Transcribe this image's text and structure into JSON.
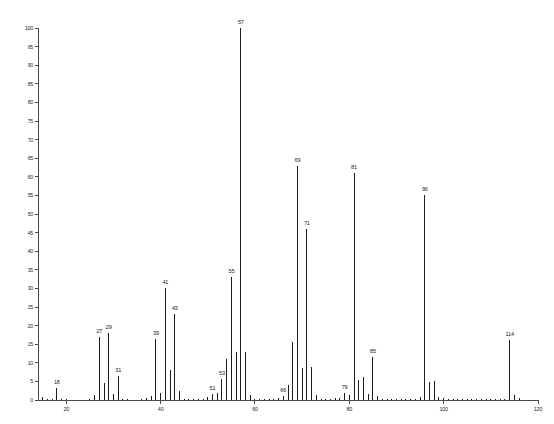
{
  "chart_data": {
    "type": "bar",
    "title": "",
    "subtitle": "",
    "xlabel": "",
    "ylabel": "",
    "xlim": [
      14,
      120
    ],
    "ylim": [
      0,
      100
    ],
    "grid": false,
    "legend": null,
    "x_ticks": [
      20,
      40,
      60,
      80,
      100,
      120
    ],
    "x_tick_labels": [
      "20",
      "40",
      "60",
      "80",
      "100",
      "120"
    ],
    "y_ticks": [
      0,
      5,
      10,
      15,
      20,
      25,
      30,
      35,
      40,
      45,
      50,
      55,
      60,
      65,
      70,
      75,
      80,
      85,
      90,
      95,
      100
    ],
    "y_tick_labels": [
      "0",
      "5",
      "10",
      "15",
      "20",
      "25",
      "30",
      "35",
      "40",
      "45",
      "50",
      "55",
      "60",
      "65",
      "70",
      "75",
      "80",
      "85",
      "90",
      "95",
      "100"
    ],
    "x": [
      15,
      16,
      17,
      18,
      19,
      20,
      25,
      26,
      27,
      28,
      29,
      30,
      31,
      32,
      33,
      36,
      37,
      38,
      39,
      40,
      41,
      42,
      43,
      44,
      45,
      46,
      47,
      48,
      49,
      50,
      51,
      52,
      53,
      54,
      55,
      56,
      57,
      58,
      59,
      60,
      61,
      62,
      63,
      64,
      65,
      66,
      67,
      68,
      69,
      70,
      71,
      72,
      73,
      74,
      75,
      76,
      77,
      78,
      79,
      80,
      81,
      82,
      83,
      84,
      85,
      86,
      87,
      88,
      89,
      90,
      91,
      92,
      93,
      94,
      95,
      96,
      97,
      98,
      99,
      100,
      101,
      102,
      103,
      104,
      105,
      106,
      107,
      108,
      109,
      110,
      111,
      112,
      113,
      114,
      115,
      116
    ],
    "values": [
      0.8,
      0.4,
      0.3,
      3.2,
      0.3,
      0.2,
      0.3,
      1.4,
      17.0,
      4.5,
      18.0,
      1.5,
      6.5,
      0.4,
      0.2,
      0.3,
      0.6,
      1.2,
      16.5,
      2.0,
      30.0,
      8.0,
      23.0,
      2.3,
      0.4,
      0.3,
      0.3,
      0.2,
      0.4,
      0.9,
      1.6,
      2.0,
      5.7,
      11.0,
      33.0,
      13.0,
      100.0,
      13.0,
      1.3,
      0.4,
      0.3,
      0.3,
      0.3,
      0.3,
      0.6,
      1.2,
      4.0,
      15.5,
      63.0,
      8.5,
      46.0,
      9.0,
      1.3,
      0.4,
      0.3,
      0.3,
      0.5,
      0.6,
      2.0,
      1.3,
      61.0,
      5.5,
      6.3,
      1.7,
      11.5,
      1.2,
      0.4,
      0.3,
      0.2,
      0.2,
      0.4,
      0.3,
      0.2,
      0.3,
      0.8,
      55.0,
      4.8,
      5.0,
      0.7,
      0.6,
      0.3,
      0.2,
      0.2,
      0.2,
      0.2,
      0.2,
      0.2,
      0.2,
      0.2,
      0.3,
      0.3,
      0.3,
      0.4,
      16.0,
      1.3,
      0.5
    ],
    "labeled_peaks": [
      {
        "mz": 18,
        "label": "18",
        "intensity": 3.2
      },
      {
        "mz": 27,
        "label": "27",
        "intensity": 17.0
      },
      {
        "mz": 29,
        "label": "29",
        "intensity": 18.0
      },
      {
        "mz": 31,
        "label": "31",
        "intensity": 6.5
      },
      {
        "mz": 39,
        "label": "39",
        "intensity": 16.5
      },
      {
        "mz": 41,
        "label": "41",
        "intensity": 30.0
      },
      {
        "mz": 43,
        "label": "43",
        "intensity": 23.0
      },
      {
        "mz": 51,
        "label": "51",
        "intensity": 1.6
      },
      {
        "mz": 53,
        "label": "53",
        "intensity": 5.7
      },
      {
        "mz": 55,
        "label": "55",
        "intensity": 33.0
      },
      {
        "mz": 57,
        "label": "57",
        "intensity": 100.0
      },
      {
        "mz": 66,
        "label": "66",
        "intensity": 1.2
      },
      {
        "mz": 69,
        "label": "69",
        "intensity": 63.0
      },
      {
        "mz": 71,
        "label": "71",
        "intensity": 46.0
      },
      {
        "mz": 79,
        "label": "79",
        "intensity": 2.0
      },
      {
        "mz": 81,
        "label": "81",
        "intensity": 61.0
      },
      {
        "mz": 85,
        "label": "85",
        "intensity": 11.5
      },
      {
        "mz": 96,
        "label": "96",
        "intensity": 55.0
      },
      {
        "mz": 114,
        "label": "114",
        "intensity": 16.0
      }
    ]
  }
}
